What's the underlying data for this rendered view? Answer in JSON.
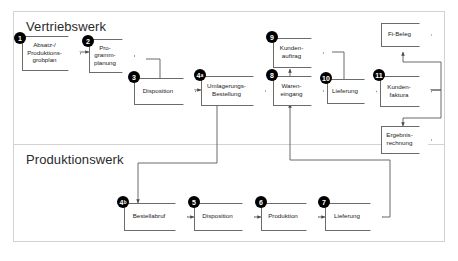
{
  "diagram": {
    "colors": {
      "frame_border": "#d2d2d2",
      "node_border": "#6b6b6b",
      "node_fill": "#ffffff",
      "badge_fill": "#000000",
      "badge_text": "#ffffff",
      "connector": "#5a5a5a",
      "background": "#ffffff"
    },
    "lanes": [
      {
        "id": "vertriebswerk",
        "label": "Vertriebswerk"
      },
      {
        "id": "produktionswerk",
        "label": "Produktionswerk"
      }
    ],
    "nodes": [
      {
        "id": "absatz",
        "badge": "1",
        "badge_sub": "",
        "label": "Absatz-/\nProduktions-\ngrobplan",
        "lane": "vertriebswerk"
      },
      {
        "id": "programm",
        "badge": "2",
        "badge_sub": "",
        "label": "Pro-\ngramm-\nplanung",
        "lane": "vertriebswerk"
      },
      {
        "id": "disposition1",
        "badge": "3",
        "badge_sub": "",
        "label": "Disposition",
        "lane": "vertriebswerk"
      },
      {
        "id": "umlagerung",
        "badge": "4",
        "badge_sub": "a",
        "label": "Umlagerungs-\nBestellung",
        "lane": "vertriebswerk"
      },
      {
        "id": "wareneingang",
        "badge": "8",
        "badge_sub": "",
        "label": "Waren-\neingang",
        "lane": "vertriebswerk"
      },
      {
        "id": "kundenauftrag",
        "badge": "9",
        "badge_sub": "",
        "label": "Kunden-\nauftrag",
        "lane": "vertriebswerk"
      },
      {
        "id": "lieferung_v",
        "badge": "10",
        "badge_sub": "",
        "label": "Lieferung",
        "lane": "vertriebswerk"
      },
      {
        "id": "kundenfaktura",
        "badge": "11",
        "badge_sub": "",
        "label": "Kunden-\nfaktura",
        "lane": "vertriebswerk"
      },
      {
        "id": "fibeleg",
        "badge": "",
        "badge_sub": "",
        "label": "Fi-Beleg",
        "lane": "vertriebswerk"
      },
      {
        "id": "ergebnis",
        "badge": "",
        "badge_sub": "",
        "label": "Ergebnis-\nrechnung",
        "lane": "vertriebswerk"
      },
      {
        "id": "bestellabruf",
        "badge": "4",
        "badge_sub": "b",
        "label": "Bestellabruf",
        "lane": "produktionswerk"
      },
      {
        "id": "disposition2",
        "badge": "5",
        "badge_sub": "",
        "label": "Disposition",
        "lane": "produktionswerk"
      },
      {
        "id": "produktion",
        "badge": "6",
        "badge_sub": "",
        "label": "Produktion",
        "lane": "produktionswerk"
      },
      {
        "id": "lieferung_p",
        "badge": "7",
        "badge_sub": "",
        "label": "Lieferung",
        "lane": "produktionswerk"
      }
    ],
    "connections": [
      {
        "from": "absatz",
        "to": "programm",
        "type": "direct"
      },
      {
        "from": "programm",
        "to": "disposition1",
        "type": "orthogonal"
      },
      {
        "from": "disposition1",
        "to": "umlagerung",
        "type": "direct"
      },
      {
        "from": "umlagerung",
        "to": "bestellabruf",
        "type": "orthogonal"
      },
      {
        "from": "bestellabruf",
        "to": "disposition2",
        "type": "direct"
      },
      {
        "from": "disposition2",
        "to": "produktion",
        "type": "direct"
      },
      {
        "from": "produktion",
        "to": "lieferung_p",
        "type": "direct"
      },
      {
        "from": "lieferung_p",
        "to": "wareneingang",
        "type": "orthogonal"
      },
      {
        "from": "wareneingang",
        "to": "kundenauftrag",
        "type": "direct-up"
      },
      {
        "from": "kundenauftrag",
        "to": "lieferung_v",
        "type": "orthogonal"
      },
      {
        "from": "lieferung_v",
        "to": "kundenfaktura",
        "type": "direct"
      },
      {
        "from": "kundenfaktura",
        "to": "fibeleg",
        "type": "orthogonal-up"
      },
      {
        "from": "kundenfaktura",
        "to": "ergebnis",
        "type": "orthogonal-down"
      }
    ]
  }
}
